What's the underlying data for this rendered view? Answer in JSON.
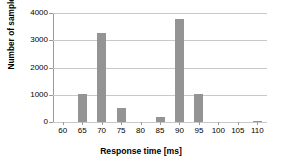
{
  "chart_data": {
    "type": "bar",
    "title": "",
    "xlabel": "Response time [ms]",
    "ylabel": "Number of samples",
    "categories": [
      "60",
      "65",
      "70",
      "75",
      "80",
      "85",
      "90",
      "95",
      "100",
      "105",
      "110"
    ],
    "values": [
      0,
      1030,
      3250,
      515,
      0,
      185,
      3770,
      1040,
      0,
      0,
      50
    ],
    "xlim": [
      57.5,
      112.5
    ],
    "ylim": [
      0,
      4000
    ],
    "ytick_labels": [
      "0",
      "1000",
      "2000",
      "3000",
      "4000"
    ],
    "ytick_values": [
      0,
      1000,
      2000,
      3000,
      4000
    ],
    "xtick_labels": [
      "60",
      "65",
      "70",
      "75",
      "80",
      "85",
      "90",
      "95",
      "100",
      "105",
      "110"
    ],
    "grid": "horizontal",
    "legend": "none",
    "bar_color": "#949494",
    "gridline_color": "#c9c9c9",
    "axis_color": "#9a9a9a",
    "background_color": "#ffffff"
  }
}
